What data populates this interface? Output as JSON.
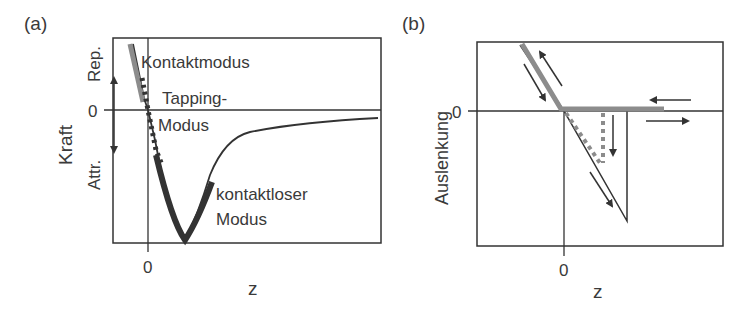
{
  "figure": {
    "panel_a": {
      "label": "(a)",
      "ylabel": "Kraft",
      "xlabel": "z",
      "y_zero_tick": "0",
      "x_zero_tick": "0",
      "rep_label": "Rep.",
      "attr_label": "Attr.",
      "annotations": {
        "contact": "Kontaktmodus",
        "tapping_line1": "Tapping-",
        "tapping_line2": "Modus",
        "noncontact_line1": "kontaktloser",
        "noncontact_line2": "Modus"
      }
    },
    "panel_b": {
      "label": "(b)",
      "ylabel": "Auslenkung",
      "xlabel": "z",
      "y_zero_tick": "0",
      "x_zero_tick": "0"
    },
    "colors": {
      "ink": "#333333",
      "gray_highlight": "#8c8c8c",
      "background": "#ffffff"
    }
  }
}
